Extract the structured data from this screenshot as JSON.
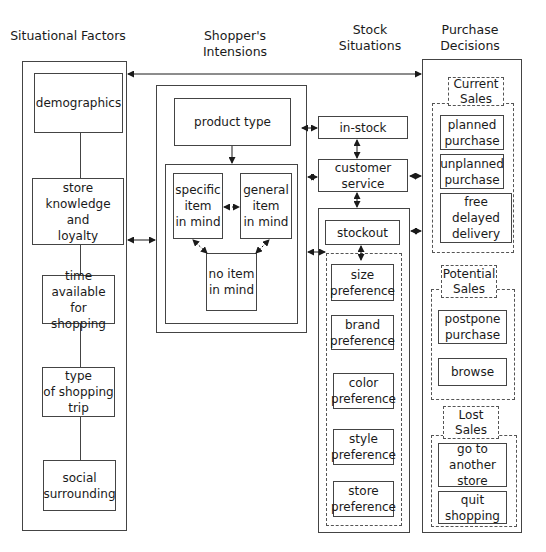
{
  "columns": {
    "situational": "Situational Factors",
    "intentions": "Shopper's Intensions",
    "stock": "Stock\nSituations",
    "decisions": "Purchase\nDecisions"
  },
  "situational_factors": [
    "demographics",
    "store\nknowledge\nand\nloyalty",
    "time\navailable for\nshopping",
    "type\nof shopping\ntrip",
    "social\nsurrounding"
  ],
  "intentions": {
    "product_type": "product type",
    "specific": "specific\nitem\nin mind",
    "general": "general\nitem\nin mind",
    "none": "no item\nin mind"
  },
  "stock": {
    "in_stock": "in-stock",
    "customer_service": "customer\nservice",
    "stockout": "stockout",
    "preferences": [
      "size\npreference",
      "brand\npreference",
      "color\npreference",
      "style\npreference",
      "store\npreference"
    ]
  },
  "decisions": {
    "current_label": "Current\nSales",
    "current": [
      "planned\npurchase",
      "unplanned\npurchase",
      "free delayed\ndelivery"
    ],
    "potential_label": "Potential\nSales",
    "potential": [
      "postpone\npurchase",
      "browse"
    ],
    "lost_label": "Lost\nSales",
    "lost": [
      "go to\nanother\nstore",
      "quit\nshopping"
    ]
  }
}
